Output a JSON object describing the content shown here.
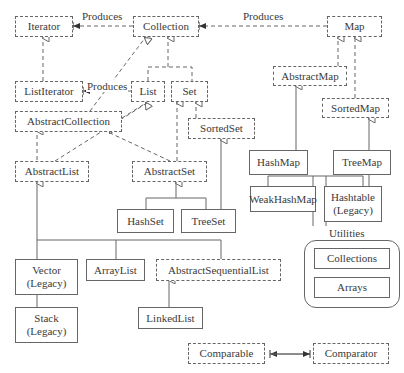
{
  "diagram": {
    "nodes": {
      "iterator": "Iterator",
      "collection": "Collection",
      "map": "Map",
      "listiterator": "ListIterator",
      "list": "List",
      "set": "Set",
      "abstractmap": "AbstractMap",
      "sortedmap": "SortedMap",
      "abstractcollection": "AbstractCollection",
      "sortedset": "SortedSet",
      "abstractlist": "AbstractList",
      "abstractset": "AbstractSet",
      "hashmap": "HashMap",
      "treemap": "TreeMap",
      "weakhashmap": "WeakHashMap",
      "hashtable": "Hashtable",
      "hashtable_note": "(Legacy)",
      "hashset": "HashSet",
      "treeset": "TreeSet",
      "vector": "Vector",
      "vector_note": "(Legacy)",
      "arraylist": "ArrayList",
      "abstractsequentiallist": "AbstractSequentialList",
      "linkedlist": "LinkedList",
      "stack": "Stack",
      "stack_note": "(Legacy)",
      "comparable": "Comparable",
      "comparator": "Comparator",
      "collections": "Collections",
      "arrays": "Arrays"
    },
    "labels": {
      "produces_1": "Produces",
      "produces_2": "Produces",
      "produces_3": "Produces",
      "utilities": "Utilities"
    },
    "legend": {
      "dashed_box": "interface",
      "solid_box": "class"
    },
    "colors": {
      "line": "#666666",
      "text": "#3a3a3a",
      "background": "#ffffff"
    }
  }
}
